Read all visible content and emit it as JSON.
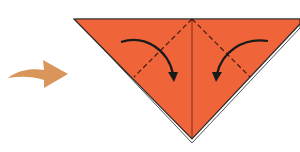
{
  "diagram": {
    "type": "origami-step",
    "description": "Fold both top corners of the triangle down to the center line",
    "colors": {
      "paper": "#f0643a",
      "paper_edge": "#2a2a2a",
      "fold_line": "#3a1a10",
      "action_arrow": "#1a1a1a",
      "step_arrow": "#d9955a",
      "background": "#ffffff"
    },
    "elements": {
      "step_arrow": "curved step-transition arrow",
      "paper": "inverted triangle (paper folded in half diagonally)",
      "center_crease": "vertical center crease",
      "left_fold_line": "dashed valley fold line (left)",
      "right_fold_line": "dashed valley fold line (right)",
      "left_fold_arrow": "curved arrow folding left corner down",
      "right_fold_arrow": "curved arrow folding right corner down"
    }
  }
}
